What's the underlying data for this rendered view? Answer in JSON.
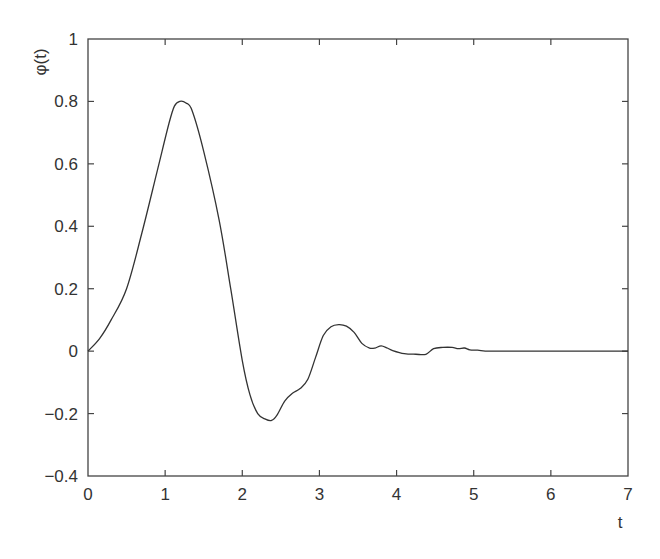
{
  "chart_data": {
    "type": "line",
    "title": "",
    "xlabel": "t",
    "ylabel": "φ(t)",
    "xlim": [
      0,
      7
    ],
    "ylim": [
      -0.4,
      1
    ],
    "grid": false,
    "legend": null,
    "x_ticks": [
      "0",
      "1",
      "2",
      "3",
      "4",
      "5",
      "6",
      "7"
    ],
    "y_ticks": [
      "−0.4",
      "−0.2",
      "0",
      "0.2",
      "0.4",
      "0.6",
      "0.8",
      "1"
    ],
    "series": [
      {
        "name": "φ(t)",
        "color": "#333333",
        "x": [
          0,
          0.15,
          0.3,
          0.5,
          0.7,
          0.9,
          1.05,
          1.12,
          1.19,
          1.27,
          1.35,
          1.5,
          1.7,
          1.85,
          2.0,
          2.1,
          2.2,
          2.3,
          2.38,
          2.45,
          2.55,
          2.65,
          2.75,
          2.85,
          2.95,
          3.05,
          3.15,
          3.25,
          3.35,
          3.45,
          3.55,
          3.65,
          3.72,
          3.8,
          3.88,
          3.95,
          4.1,
          4.25,
          4.38,
          4.48,
          4.6,
          4.72,
          4.8,
          4.88,
          4.95,
          5.05,
          5.2,
          5.5,
          6.0,
          6.5,
          7.0
        ],
        "y": [
          0,
          0.04,
          0.1,
          0.2,
          0.38,
          0.58,
          0.73,
          0.785,
          0.8,
          0.795,
          0.77,
          0.64,
          0.42,
          0.2,
          -0.03,
          -0.14,
          -0.2,
          -0.218,
          -0.222,
          -0.205,
          -0.16,
          -0.135,
          -0.12,
          -0.09,
          -0.02,
          0.05,
          0.078,
          0.085,
          0.08,
          0.06,
          0.025,
          0.01,
          0.01,
          0.017,
          0.01,
          0.002,
          -0.008,
          -0.01,
          -0.01,
          0.008,
          0.012,
          0.012,
          0.008,
          0.01,
          0.004,
          0.003,
          0.0,
          0.0,
          0.0,
          0.0,
          0.0
        ]
      }
    ]
  }
}
